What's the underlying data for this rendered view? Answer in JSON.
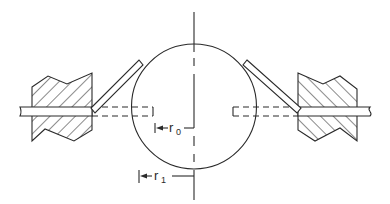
{
  "figure": {
    "type": "cross-section schematic",
    "labels": {
      "r0": {
        "main": "r",
        "sub": "0"
      },
      "r1": {
        "main": "r",
        "sub": "1"
      }
    },
    "elements": [
      "left-hatched-block",
      "right-hatched-block",
      "left-rod",
      "right-rod",
      "left-angled-strip",
      "right-angled-strip",
      "circle",
      "vertical-centerline",
      "left-dashed-extension",
      "right-dashed-extension",
      "r0-dimension",
      "r1-dimension"
    ]
  },
  "colors": {
    "line": "#2a2a2a",
    "background": "#ffffff"
  }
}
